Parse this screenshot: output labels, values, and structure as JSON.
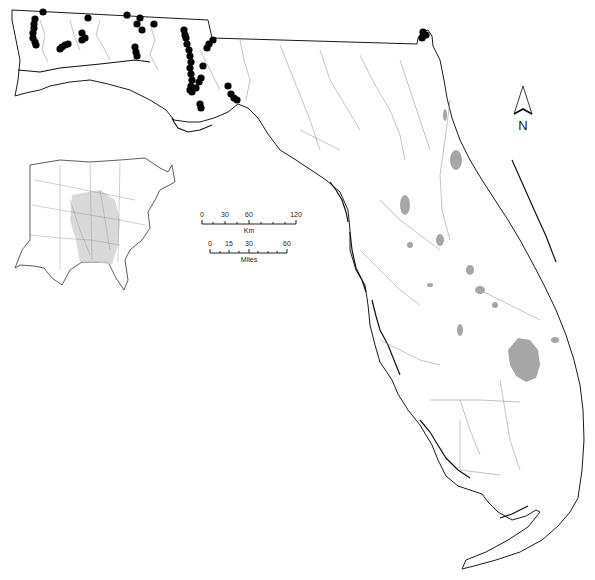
{
  "map": {
    "region": "Florida",
    "colors": {
      "background": "#ffffff",
      "state_outline": "#1a1a1a",
      "rivers": "#9a9a9a",
      "lakes": "#a6a6a6",
      "sample_points": "#000000",
      "inset_shading": "#d0d0d0"
    }
  },
  "north_arrow": {
    "label": "N"
  },
  "scale_bar_km": {
    "unit_label": "Km",
    "ticks": [
      "0",
      "30",
      "60",
      "120"
    ]
  },
  "scale_bar_miles": {
    "unit_label": "Miles",
    "ticks": [
      "0",
      "15",
      "30",
      "60"
    ]
  },
  "inset": {
    "description": "Eastern United States locator map with river basins; Mississippi/Gulf drainage shaded"
  },
  "sample_points": [
    [
      43,
      12
    ],
    [
      35,
      19
    ],
    [
      34,
      24
    ],
    [
      34,
      28
    ],
    [
      33,
      33
    ],
    [
      33,
      38
    ],
    [
      35,
      42
    ],
    [
      36,
      45
    ],
    [
      88,
      18
    ],
    [
      82,
      33
    ],
    [
      85,
      38
    ],
    [
      82,
      40
    ],
    [
      62,
      47
    ],
    [
      65,
      45
    ],
    [
      68,
      44
    ],
    [
      60,
      49
    ],
    [
      127,
      15
    ],
    [
      140,
      18
    ],
    [
      137,
      24
    ],
    [
      142,
      30
    ],
    [
      154,
      24
    ],
    [
      135,
      47
    ],
    [
      136,
      52
    ],
    [
      137,
      56
    ],
    [
      184,
      30
    ],
    [
      185,
      35
    ],
    [
      186,
      38
    ],
    [
      187,
      44
    ],
    [
      189,
      50
    ],
    [
      190,
      56
    ],
    [
      191,
      62
    ],
    [
      190,
      68
    ],
    [
      191,
      74
    ],
    [
      192,
      80
    ],
    [
      191,
      86
    ],
    [
      190,
      90
    ],
    [
      192,
      92
    ],
    [
      196,
      88
    ],
    [
      213,
      40
    ],
    [
      209,
      44
    ],
    [
      207,
      48
    ],
    [
      203,
      66
    ],
    [
      201,
      78
    ],
    [
      199,
      82
    ],
    [
      200,
      104
    ],
    [
      201,
      108
    ],
    [
      228,
      86
    ],
    [
      231,
      94
    ],
    [
      234,
      98
    ],
    [
      237,
      100
    ],
    [
      423,
      32
    ],
    [
      426,
      35
    ],
    [
      422,
      38
    ]
  ]
}
